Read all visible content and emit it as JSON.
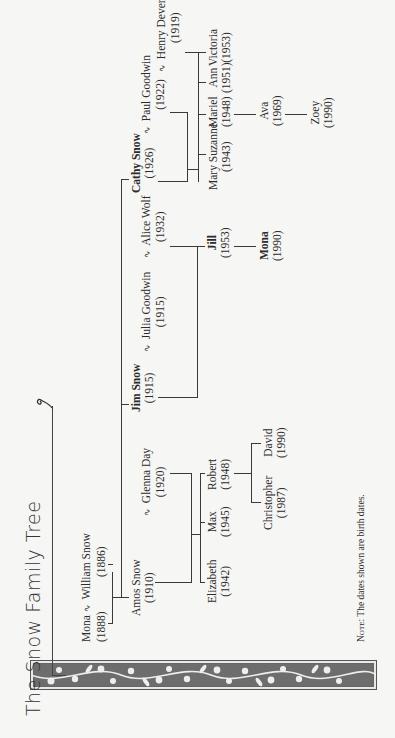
{
  "title": "The Snow Family Tree",
  "spouse_symbol": "♲",
  "note": {
    "label": "Note:",
    "text": "The dates shown are birth dates."
  },
  "people": {
    "mona_sr": {
      "name": "Mona",
      "year": "(1888)"
    },
    "william": {
      "name": "William Snow",
      "year": "(1886)"
    },
    "amos": {
      "name": "Amos Snow",
      "year": "(1910)"
    },
    "glenna": {
      "name": "Glenna Day",
      "year": "(1920)"
    },
    "jim": {
      "name": "Jim Snow",
      "year": "(1915)"
    },
    "julia": {
      "name": "Julia Goodwin",
      "year": "(1915)"
    },
    "alice": {
      "name": "Alice Wolf",
      "year": "(1932)"
    },
    "cathy": {
      "name": "Cathy Snow",
      "year": "(1926)"
    },
    "paul": {
      "name": "Paul Goodwin",
      "year": "(1922)"
    },
    "henry": {
      "name": "Henry Devereau",
      "year": "(1919)"
    },
    "elizabeth": {
      "name": "Elizabeth",
      "year": "(1942)"
    },
    "max": {
      "name": "Max",
      "year": "(1945)"
    },
    "robert": {
      "name": "Robert",
      "year": "(1948)"
    },
    "christopher": {
      "name": "Christopher",
      "year": "(1987)"
    },
    "david": {
      "name": "David",
      "year": "(1990)"
    },
    "jill": {
      "name": "Jill",
      "year": "(1953)"
    },
    "mona_jr": {
      "name": "Mona",
      "year": "(1990)"
    },
    "mary_suzanne": {
      "name": "Mary Suzanne",
      "year": "(1943)"
    },
    "mariel": {
      "name": "Mariel",
      "year": "(1948)"
    },
    "ann": {
      "name": "Ann",
      "year": "(1951)"
    },
    "victoria": {
      "name": "Victoria",
      "year": "(1953)"
    },
    "ava": {
      "name": "Ava",
      "year": "(1969)"
    },
    "zoey": {
      "name": "Zoey",
      "year": "(1990)"
    }
  },
  "highlighted": [
    "Jim Snow",
    "Cathy Snow",
    "Jill",
    "Mona (1990)"
  ]
}
